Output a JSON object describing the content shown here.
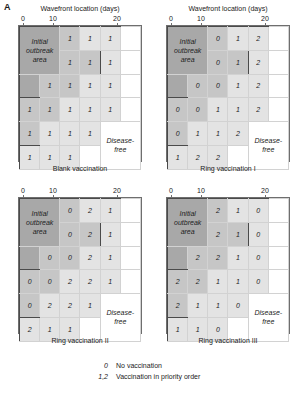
{
  "figure": {
    "panel_letter": "A",
    "axis_title": "Wavefront location (days)",
    "tick_labels": [
      "0",
      "10",
      "20"
    ],
    "tick_values": [
      0,
      10,
      20
    ],
    "outbreak_label": "Initial\noutbreak\narea",
    "outbreak_label_lines": [
      "Initial",
      "outbreak",
      "area"
    ],
    "disease_free_label": "Disease-\nfree",
    "disease_free_lines": [
      "Disease-",
      "free"
    ]
  },
  "legend": {
    "items": [
      {
        "key": "0",
        "text": "No vaccination"
      },
      {
        "key": "1,2",
        "text": "Vaccination in priority order"
      }
    ]
  },
  "colors": {
    "outbreak_fill": "#a8a8a8",
    "mid_fill": "#c6c6c6",
    "light_fill": "#e3e3e3",
    "free_fill": "#ffffff",
    "frame": "#6e6e6e",
    "hard_boundary": "#4a4a4a",
    "wavefront_dash": "#3c3c3c"
  },
  "panels": [
    {
      "id": "blank-vaccination",
      "caption": "Blank vaccination",
      "position": "top-left",
      "grid": [
        [
          "OB",
          "OB",
          "1",
          "1",
          "1",
          ""
        ],
        [
          "OB",
          "OB",
          "1",
          "1",
          "1",
          ""
        ],
        [
          "OB",
          "1",
          "1",
          "1",
          "1",
          ""
        ],
        [
          "1",
          "1",
          "1",
          "1",
          "1",
          ""
        ],
        [
          "1",
          "1",
          "1",
          "1",
          "DF",
          "DF"
        ],
        [
          "1",
          "1",
          "1",
          "",
          "DF",
          "DF"
        ]
      ],
      "shades": [
        [
          "dark",
          "dark",
          "mid",
          "light",
          "light",
          "white"
        ],
        [
          "dark",
          "dark",
          "mid",
          "mid",
          "light",
          "white"
        ],
        [
          "dark",
          "mid",
          "mid",
          "light",
          "light",
          "white"
        ],
        [
          "mid",
          "mid",
          "light",
          "light",
          "light",
          "white"
        ],
        [
          "mid",
          "light",
          "light",
          "light",
          "white",
          "white"
        ],
        [
          "light",
          "light",
          "light",
          "white",
          "white",
          "white"
        ]
      ]
    },
    {
      "id": "ring-vaccination-1",
      "caption": "Ring vaccination I",
      "position": "top-right",
      "grid": [
        [
          "OB",
          "OB",
          "0",
          "1",
          "2",
          ""
        ],
        [
          "OB",
          "OB",
          "0",
          "1",
          "2",
          ""
        ],
        [
          "OB",
          "0",
          "0",
          "1",
          "2",
          ""
        ],
        [
          "0",
          "0",
          "1",
          "1",
          "2",
          ""
        ],
        [
          "0",
          "1",
          "1",
          "2",
          "DF",
          "DF"
        ],
        [
          "1",
          "2",
          "2",
          "",
          "DF",
          "DF"
        ]
      ],
      "shades": [
        [
          "dark",
          "dark",
          "mid",
          "light",
          "light",
          "white"
        ],
        [
          "dark",
          "dark",
          "mid",
          "mid",
          "light",
          "white"
        ],
        [
          "dark",
          "mid",
          "mid",
          "light",
          "light",
          "white"
        ],
        [
          "mid",
          "mid",
          "light",
          "light",
          "light",
          "white"
        ],
        [
          "mid",
          "light",
          "light",
          "light",
          "white",
          "white"
        ],
        [
          "light",
          "light",
          "light",
          "white",
          "white",
          "white"
        ]
      ]
    },
    {
      "id": "ring-vaccination-2",
      "caption": "Ring vaccination II",
      "position": "bottom-left",
      "grid": [
        [
          "OB",
          "OB",
          "0",
          "2",
          "1",
          ""
        ],
        [
          "OB",
          "OB",
          "0",
          "2",
          "1",
          ""
        ],
        [
          "OB",
          "0",
          "0",
          "2",
          "1",
          ""
        ],
        [
          "0",
          "0",
          "2",
          "2",
          "1",
          ""
        ],
        [
          "0",
          "2",
          "2",
          "1",
          "DF",
          "DF"
        ],
        [
          "2",
          "1",
          "1",
          "",
          "DF",
          "DF"
        ]
      ],
      "shades": [
        [
          "dark",
          "dark",
          "mid",
          "light",
          "light",
          "white"
        ],
        [
          "dark",
          "dark",
          "mid",
          "mid",
          "light",
          "white"
        ],
        [
          "dark",
          "mid",
          "mid",
          "light",
          "light",
          "white"
        ],
        [
          "mid",
          "mid",
          "light",
          "light",
          "light",
          "white"
        ],
        [
          "mid",
          "light",
          "light",
          "light",
          "white",
          "white"
        ],
        [
          "light",
          "light",
          "light",
          "white",
          "white",
          "white"
        ]
      ]
    },
    {
      "id": "ring-vaccination-3",
      "caption": "Ring vaccination III",
      "position": "bottom-right",
      "grid": [
        [
          "OB",
          "OB",
          "2",
          "1",
          "0",
          ""
        ],
        [
          "OB",
          "OB",
          "2",
          "1",
          "0",
          ""
        ],
        [
          "OB",
          "2",
          "2",
          "1",
          "0",
          ""
        ],
        [
          "2",
          "2",
          "1",
          "1",
          "0",
          ""
        ],
        [
          "2",
          "1",
          "1",
          "0",
          "DF",
          "DF"
        ],
        [
          "1",
          "1",
          "0",
          "",
          "DF",
          "DF"
        ]
      ],
      "shades": [
        [
          "dark",
          "dark",
          "mid",
          "light",
          "light",
          "white"
        ],
        [
          "dark",
          "dark",
          "mid",
          "mid",
          "light",
          "white"
        ],
        [
          "dark",
          "mid",
          "mid",
          "light",
          "light",
          "white"
        ],
        [
          "mid",
          "mid",
          "light",
          "light",
          "light",
          "white"
        ],
        [
          "mid",
          "light",
          "light",
          "light",
          "white",
          "white"
        ],
        [
          "light",
          "light",
          "light",
          "white",
          "white",
          "white"
        ]
      ]
    }
  ]
}
